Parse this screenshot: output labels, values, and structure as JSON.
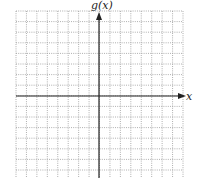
{
  "chart_data": {
    "type": "line",
    "title": "",
    "xlabel": "x",
    "ylabel": "g(x)",
    "series": [],
    "grid": true,
    "grid_style": "dotted",
    "columns": 16,
    "rows": 16,
    "xlim": [
      -8,
      8
    ],
    "ylim": [
      -8,
      8
    ],
    "tick_labels": false,
    "x_axis_arrow": true,
    "y_axis_arrow": true,
    "colors": {
      "grid": "#9a9a9a",
      "axis": "#222222",
      "background": "#ffffff"
    }
  }
}
